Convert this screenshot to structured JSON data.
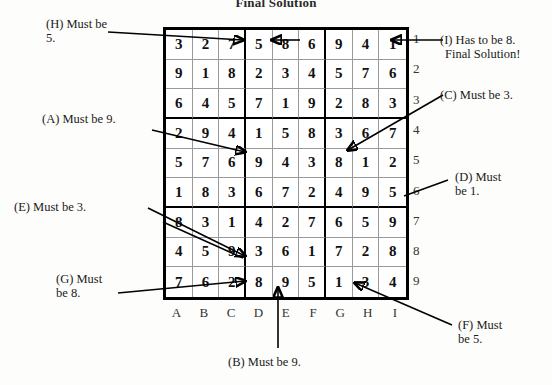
{
  "title": "Final Solution",
  "grid": {
    "columns": [
      "A",
      "B",
      "C",
      "D",
      "E",
      "F",
      "G",
      "H",
      "I"
    ],
    "rows": [
      "1",
      "2",
      "3",
      "4",
      "5",
      "6",
      "7",
      "8",
      "9"
    ],
    "values": [
      [
        "3",
        "2",
        "7",
        "5",
        "8",
        "6",
        "9",
        "4",
        "1"
      ],
      [
        "9",
        "1",
        "8",
        "2",
        "3",
        "4",
        "5",
        "7",
        "6"
      ],
      [
        "6",
        "4",
        "5",
        "7",
        "1",
        "9",
        "2",
        "8",
        "3"
      ],
      [
        "2",
        "9",
        "4",
        "1",
        "5",
        "8",
        "3",
        "6",
        "7"
      ],
      [
        "5",
        "7",
        "6",
        "9",
        "4",
        "3",
        "8",
        "1",
        "2"
      ],
      [
        "1",
        "8",
        "3",
        "6",
        "7",
        "2",
        "4",
        "9",
        "5"
      ],
      [
        "8",
        "3",
        "1",
        "4",
        "2",
        "7",
        "6",
        "5",
        "9"
      ],
      [
        "4",
        "5",
        "9",
        "3",
        "6",
        "1",
        "7",
        "2",
        "8"
      ],
      [
        "7",
        "6",
        "2",
        "8",
        "9",
        "5",
        "1",
        "3",
        "4"
      ]
    ]
  },
  "annotations": {
    "h": {
      "line1": "(H) Must be",
      "line2": "5."
    },
    "a": {
      "line1": "(A) Must be 9."
    },
    "e": {
      "line1": "(E) Must be 3."
    },
    "g": {
      "line1": "(G) Must",
      "line2": "be 8."
    },
    "i": {
      "line1": "(I) Has to be 8.",
      "line2": "Final Solution!"
    },
    "c": {
      "line1": "(C) Must be 3."
    },
    "d": {
      "line1": "(D) Must",
      "line2": "be 1."
    },
    "f": {
      "line1": "(F) Must",
      "line2": "be 5."
    },
    "b": {
      "line1": "(B) Must be 9."
    }
  },
  "colors": {
    "ink": "#1a1a1a",
    "grid_line": "#9a9a9a",
    "grid_border": "#000000",
    "paper": "#fdfdfb"
  }
}
